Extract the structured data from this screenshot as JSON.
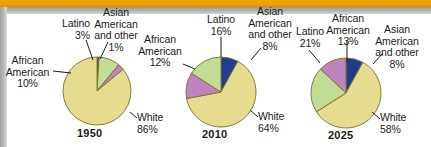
{
  "figure": {
    "background_color": "#ffffff",
    "top_rule_color": "#f0a200",
    "frame_gray": "#b4b4b4"
  },
  "palette": {
    "white_slice": "#e6dc8f",
    "african_american_slice": "#bf84bd",
    "latino_slice": "#c3dc95",
    "asian_other_slice": "#1f3c8f",
    "outline": "#7b6f2a",
    "text": "#1b1b1b",
    "leader_line": "#1b1b1b"
  },
  "chart_data": [
    {
      "type": "pie",
      "title": "1950",
      "categories": [
        "White",
        "African American",
        "Latino",
        "Asian American and other"
      ],
      "values": [
        86,
        3,
        10,
        1
      ],
      "labels": [
        "86%",
        "10%",
        "3%",
        "1%"
      ],
      "units": "percent",
      "legend": "none",
      "grid": false
    },
    {
      "type": "pie",
      "title": "2010",
      "categories": [
        "White",
        "African American",
        "Latino",
        "Asian American and other"
      ],
      "values": [
        64,
        12,
        16,
        8
      ],
      "labels": [
        "64%",
        "12%",
        "16%",
        "8%"
      ],
      "units": "percent",
      "legend": "none",
      "grid": false
    },
    {
      "type": "pie",
      "title": "2025",
      "categories": [
        "White",
        "African American",
        "Latino",
        "Asian American and other"
      ],
      "values": [
        58,
        13,
        21,
        8
      ],
      "labels": [
        "58%",
        "13%",
        "21%",
        "8%"
      ],
      "units": "percent",
      "legend": "none",
      "grid": false
    }
  ],
  "charts": [
    {
      "year": "1950",
      "labels": {
        "latino_name": "Latino",
        "latino_value": "3%",
        "asian_line1": "Asian",
        "asian_line2": "American",
        "asian_line3": "and other",
        "asian_value": "1%",
        "african_line1": "African",
        "african_line2": "American",
        "african_value": "10%",
        "white_name": "White",
        "white_value": "86%"
      }
    },
    {
      "year": "2010",
      "labels": {
        "latino_name": "Latino",
        "latino_value": "16%",
        "asian_line1": "Asian",
        "asian_line2": "American",
        "asian_line3": "and other",
        "asian_value": "8%",
        "african_line1": "African",
        "african_line2": "American",
        "african_value": "12%",
        "white_name": "White",
        "white_value": "64%"
      }
    },
    {
      "year": "2025",
      "labels": {
        "latino_name": "Latino",
        "latino_value": "21%",
        "asian_line1": "Asian",
        "asian_line2": "American",
        "asian_line3": "and other",
        "asian_value": "8%",
        "african_line1": "African",
        "african_line2": "American",
        "african_value": "13%",
        "white_name": "White",
        "white_value": "58%"
      }
    }
  ]
}
